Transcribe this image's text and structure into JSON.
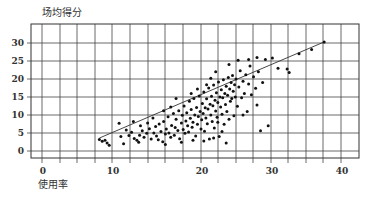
{
  "chart_data": {
    "type": "scatter",
    "title": "",
    "xlabel": "使用率",
    "ylabel": "场均得分",
    "xlim": [
      -2,
      43
    ],
    "ylim": [
      -2,
      35
    ],
    "x_ticks": [
      0,
      10,
      20,
      30,
      40
    ],
    "y_ticks": [
      0,
      5,
      10,
      15,
      20,
      25,
      30
    ],
    "grid": true,
    "legend": null,
    "trendline": {
      "x": [
        8.2,
        37.6
      ],
      "y": [
        3.6,
        30.3
      ]
    },
    "series": [
      {
        "name": "球员",
        "points": [
          [
            8.2,
            3.2
          ],
          [
            8.6,
            2.7
          ],
          [
            9.0,
            3.0
          ],
          [
            9.3,
            2.2
          ],
          [
            9.6,
            1.6
          ],
          [
            10.8,
            7.7
          ],
          [
            11.0,
            4.0
          ],
          [
            11.3,
            2.0
          ],
          [
            11.6,
            5.8
          ],
          [
            11.9,
            4.3
          ],
          [
            12.2,
            5.2
          ],
          [
            12.5,
            3.5
          ],
          [
            12.8,
            3.0
          ],
          [
            13.1,
            4.4
          ],
          [
            13.4,
            5.6
          ],
          [
            13.6,
            3.8
          ],
          [
            13.9,
            4.9
          ],
          [
            14.2,
            6.2
          ],
          [
            14.4,
            3.3
          ],
          [
            14.7,
            5.0
          ],
          [
            14.9,
            6.8
          ],
          [
            15.0,
            4.2
          ],
          [
            15.2,
            3.1
          ],
          [
            15.3,
            7.5
          ],
          [
            15.5,
            5.4
          ],
          [
            15.7,
            2.6
          ],
          [
            15.8,
            8.2
          ],
          [
            16.0,
            4.7
          ],
          [
            16.1,
            6.1
          ],
          [
            16.3,
            9.5
          ],
          [
            16.4,
            5.0
          ],
          [
            16.6,
            3.8
          ],
          [
            16.7,
            7.1
          ],
          [
            16.9,
            10.4
          ],
          [
            17.0,
            4.4
          ],
          [
            17.1,
            6.5
          ],
          [
            17.2,
            8.8
          ],
          [
            17.4,
            5.7
          ],
          [
            17.5,
            11.2
          ],
          [
            17.6,
            3.4
          ],
          [
            17.8,
            7.8
          ],
          [
            17.9,
            9.9
          ],
          [
            18.0,
            6.0
          ],
          [
            18.1,
            12.5
          ],
          [
            18.2,
            4.9
          ],
          [
            18.3,
            8.3
          ],
          [
            18.4,
            10.6
          ],
          [
            18.5,
            7.0
          ],
          [
            18.6,
            5.3
          ],
          [
            18.7,
            13.8
          ],
          [
            18.8,
            9.1
          ],
          [
            18.9,
            11.5
          ],
          [
            19.0,
            6.6
          ],
          [
            19.1,
            8.0
          ],
          [
            19.2,
            14.6
          ],
          [
            19.3,
            10.0
          ],
          [
            19.4,
            4.2
          ],
          [
            19.5,
            12.1
          ],
          [
            19.6,
            7.4
          ],
          [
            19.7,
            9.6
          ],
          [
            19.8,
            15.3
          ],
          [
            19.9,
            11.0
          ],
          [
            20.0,
            6.1
          ],
          [
            20.1,
            8.7
          ],
          [
            20.2,
            13.2
          ],
          [
            20.3,
            10.4
          ],
          [
            20.4,
            16.4
          ],
          [
            20.5,
            5.5
          ],
          [
            20.6,
            12.0
          ],
          [
            20.7,
            9.2
          ],
          [
            20.8,
            14.5
          ],
          [
            20.9,
            7.6
          ],
          [
            21.0,
            11.7
          ],
          [
            21.1,
            17.5
          ],
          [
            21.2,
            3.3
          ],
          [
            21.3,
            13.0
          ],
          [
            21.4,
            10.0
          ],
          [
            21.5,
            15.2
          ],
          [
            21.6,
            8.2
          ],
          [
            21.7,
            12.6
          ],
          [
            21.8,
            18.3
          ],
          [
            21.9,
            6.4
          ],
          [
            22.0,
            14.1
          ],
          [
            22.1,
            11.1
          ],
          [
            22.2,
            16.2
          ],
          [
            22.3,
            9.4
          ],
          [
            22.4,
            13.5
          ],
          [
            22.5,
            19.2
          ],
          [
            22.6,
            4.0
          ],
          [
            22.7,
            15.0
          ],
          [
            22.8,
            12.2
          ],
          [
            22.9,
            17.0
          ],
          [
            23.0,
            10.2
          ],
          [
            23.1,
            14.8
          ],
          [
            23.2,
            19.8
          ],
          [
            23.3,
            7.4
          ],
          [
            23.4,
            16.0
          ],
          [
            23.5,
            12.9
          ],
          [
            23.6,
            18.0
          ],
          [
            23.7,
            11.0
          ],
          [
            23.8,
            15.5
          ],
          [
            23.9,
            20.4
          ],
          [
            24.0,
            8.8
          ],
          [
            24.1,
            17.2
          ],
          [
            24.2,
            13.8
          ],
          [
            24.3,
            19.0
          ],
          [
            24.4,
            14.6
          ],
          [
            24.5,
            21.0
          ],
          [
            24.6,
            16.6
          ],
          [
            24.7,
            9.8
          ],
          [
            24.8,
            18.4
          ],
          [
            24.9,
            15.0
          ],
          [
            25.0,
            20.0
          ],
          [
            25.2,
            12.4
          ],
          [
            25.4,
            17.8
          ],
          [
            25.6,
            22.3
          ],
          [
            25.8,
            14.8
          ],
          [
            26.0,
            19.4
          ],
          [
            26.2,
            16.0
          ],
          [
            26.4,
            21.2
          ],
          [
            26.6,
            11.0
          ],
          [
            26.8,
            18.6
          ],
          [
            27.0,
            23.6
          ],
          [
            27.2,
            15.6
          ],
          [
            27.5,
            20.6
          ],
          [
            27.8,
            17.4
          ],
          [
            28.0,
            12.8
          ],
          [
            28.2,
            22.0
          ],
          [
            28.5,
            5.6
          ],
          [
            28.8,
            19.0
          ],
          [
            29.2,
            25.4
          ],
          [
            30.2,
            25.8
          ],
          [
            31.0,
            23.0
          ],
          [
            32.3,
            22.8
          ],
          [
            32.6,
            21.8
          ],
          [
            34.0,
            27.0
          ],
          [
            35.8,
            28.2
          ],
          [
            37.6,
            30.3
          ],
          [
            29.6,
            7.0
          ],
          [
            26.0,
            10.0
          ],
          [
            23.6,
            2.2
          ],
          [
            22.4,
            8.0
          ],
          [
            17.2,
            14.6
          ],
          [
            15.8,
            11.2
          ],
          [
            16.6,
            12.2
          ],
          [
            14.6,
            9.2
          ],
          [
            18.9,
            16.0
          ],
          [
            19.6,
            17.2
          ],
          [
            20.8,
            18.4
          ],
          [
            21.4,
            20.2
          ],
          [
            22.1,
            22.0
          ],
          [
            24.0,
            24.0
          ],
          [
            25.3,
            25.2
          ],
          [
            26.8,
            25.4
          ],
          [
            28.0,
            26.0
          ],
          [
            12.4,
            8.2
          ],
          [
            13.2,
            7.0
          ],
          [
            14.0,
            7.8
          ],
          [
            13.0,
            2.4
          ],
          [
            16.0,
            1.8
          ],
          [
            17.8,
            2.4
          ],
          [
            19.1,
            3.0
          ],
          [
            20.4,
            2.8
          ],
          [
            21.8,
            3.6
          ],
          [
            23.0,
            5.4
          ]
        ]
      }
    ]
  },
  "axis": {
    "ylabel": "场均得分",
    "xlabel": "使用率"
  }
}
